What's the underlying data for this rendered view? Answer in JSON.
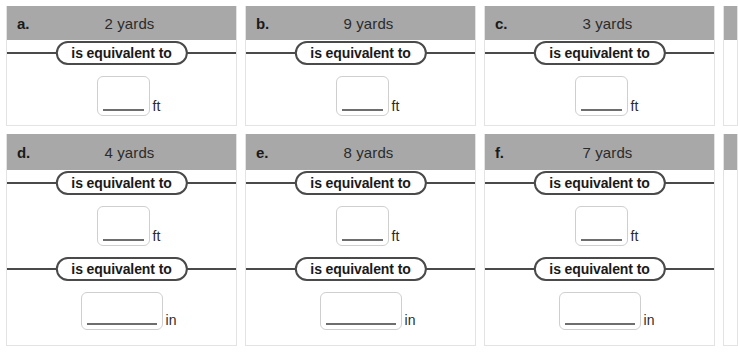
{
  "worksheet": {
    "equiv_label": "is equivalent to",
    "unit_ft": "ft",
    "unit_in": "in",
    "colors": {
      "header_gray": "#a8a8a8",
      "rule_dark": "#4a4a4a",
      "box_border": "#cfcfcf",
      "underline": "#6e6e6e",
      "card_border": "#e3e3e3"
    },
    "problems": [
      {
        "letter": "a.",
        "quantity": "2 yards",
        "conversions": [
          {
            "label": "is equivalent to",
            "unit": "ft",
            "value": ""
          }
        ]
      },
      {
        "letter": "b.",
        "quantity": "9 yards",
        "conversions": [
          {
            "label": "is equivalent to",
            "unit": "ft",
            "value": ""
          }
        ]
      },
      {
        "letter": "c.",
        "quantity": "3 yards",
        "conversions": [
          {
            "label": "is equivalent to",
            "unit": "ft",
            "value": ""
          }
        ]
      },
      {
        "letter": "d.",
        "quantity": "4 yards",
        "conversions": [
          {
            "label": "is equivalent to",
            "unit": "ft",
            "value": ""
          },
          {
            "label": "is equivalent to",
            "unit": "in",
            "value": ""
          }
        ]
      },
      {
        "letter": "e.",
        "quantity": "8 yards",
        "conversions": [
          {
            "label": "is equivalent to",
            "unit": "ft",
            "value": ""
          },
          {
            "label": "is equivalent to",
            "unit": "in",
            "value": ""
          }
        ]
      },
      {
        "letter": "f.",
        "quantity": "7 yards",
        "conversions": [
          {
            "label": "is equivalent to",
            "unit": "ft",
            "value": ""
          },
          {
            "label": "is equivalent to",
            "unit": "in",
            "value": ""
          }
        ]
      }
    ]
  }
}
